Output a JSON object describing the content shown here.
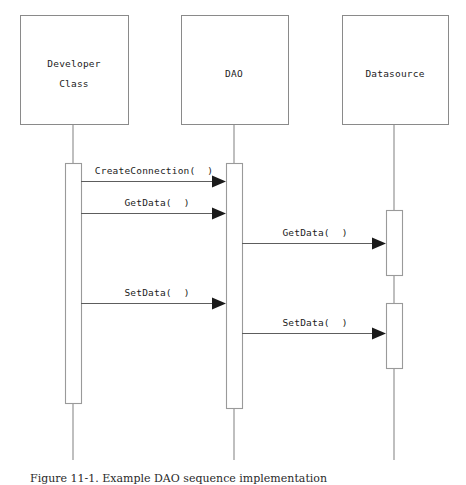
{
  "diagram": {
    "type": "uml-sequence-diagram",
    "width": 466,
    "height": 485,
    "background_color": "#ffffff",
    "box_stroke_color": "#8a8a8a",
    "lifeline_color": "#8a8a8a",
    "activation_stroke_color": "#9a9a9a",
    "message_line_color": "#5d5d5d",
    "arrowhead_color": "#1b1b1b",
    "text_color": "#1b1b1b"
  },
  "participants": [
    {
      "id": "developer",
      "label_line1": "Developer",
      "label_line2": "Class",
      "box": {
        "x": 20,
        "y": 15,
        "width": 108,
        "height": 109
      },
      "lifeline_x": 73,
      "lifeline_bottom": 460
    },
    {
      "id": "dao",
      "label_line1": "DAO",
      "label_line2": "",
      "box": {
        "x": 181,
        "y": 15,
        "width": 107,
        "height": 109
      },
      "lifeline_x": 234,
      "lifeline_bottom": 460
    },
    {
      "id": "datasource",
      "label_line1": "Datasource",
      "label_line2": "",
      "box": {
        "x": 342,
        "y": 15,
        "width": 106,
        "height": 109
      },
      "lifeline_x": 394,
      "lifeline_bottom": 460
    }
  ],
  "activations": [
    {
      "id": "activation-developer",
      "participant": "developer",
      "x": 65,
      "y": 163,
      "width": 16,
      "height": 240
    },
    {
      "id": "activation-dao",
      "participant": "dao",
      "x": 226,
      "y": 163,
      "width": 16,
      "height": 245
    },
    {
      "id": "activation-datasource-get",
      "participant": "datasource",
      "x": 386,
      "y": 210,
      "width": 16,
      "height": 65
    },
    {
      "id": "activation-datasource-set",
      "participant": "datasource",
      "x": 386,
      "y": 303,
      "width": 16,
      "height": 65
    }
  ],
  "messages": [
    {
      "id": "msg-create-connection",
      "label": "CreateConnection(  )",
      "from": "developer",
      "to": "dao",
      "x1": 81,
      "x2": 226,
      "y": 181,
      "label_x": 154,
      "label_y": 174
    },
    {
      "id": "msg-getdata-dao",
      "label": "GetData(  )",
      "from": "developer",
      "to": "dao",
      "x1": 81,
      "x2": 226,
      "y": 213,
      "label_x": 157,
      "label_y": 206
    },
    {
      "id": "msg-getdata-datasource",
      "label": "GetData(  )",
      "from": "dao",
      "to": "datasource",
      "x1": 242,
      "x2": 386,
      "y": 243,
      "label_x": 315,
      "label_y": 236
    },
    {
      "id": "msg-setdata-dao",
      "label": "SetData(  )",
      "from": "developer",
      "to": "dao",
      "x1": 81,
      "x2": 226,
      "y": 303,
      "label_x": 157,
      "label_y": 296
    },
    {
      "id": "msg-setdata-datasource",
      "label": "SetData(  )",
      "from": "dao",
      "to": "datasource",
      "x1": 242,
      "x2": 386,
      "y": 333,
      "label_x": 315,
      "label_y": 326
    }
  ],
  "caption": {
    "text": "Figure 11-1. Example DAO sequence implementation"
  }
}
